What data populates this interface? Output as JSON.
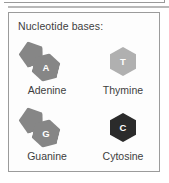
{
  "panel": {
    "title": "Nucleotide bases:",
    "border_color": "#9b9b9b",
    "background_color": "#fdfdfd",
    "text_color": "#3d3d3d"
  },
  "bases": [
    {
      "name": "Adenine",
      "letter": "A",
      "ring_type": "purine",
      "shape": "pentagon-hexagon-fused",
      "fill_color": "#868686",
      "letter_color": "#ffffff"
    },
    {
      "name": "Thymine",
      "letter": "T",
      "ring_type": "pyrimidine",
      "shape": "hexagon",
      "fill_color": "#b0b0b0",
      "letter_color": "#ffffff"
    },
    {
      "name": "Guanine",
      "letter": "G",
      "ring_type": "purine",
      "shape": "pentagon-hexagon-fused",
      "fill_color": "#868686",
      "letter_color": "#ffffff"
    },
    {
      "name": "Cytosine",
      "letter": "C",
      "ring_type": "pyrimidine",
      "shape": "hexagon",
      "fill_color": "#2b2b2b",
      "letter_color": "#ffffff"
    }
  ]
}
